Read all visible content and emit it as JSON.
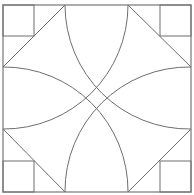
{
  "diagram": {
    "title": "",
    "stroke_color": "#6e6e6e",
    "frame_color": "#8a8a8a",
    "background": "#ffffff",
    "frame": {
      "x": 3,
      "y": 5,
      "size": 188
    },
    "corner_square_size": 31,
    "arc_radius": 124
  }
}
